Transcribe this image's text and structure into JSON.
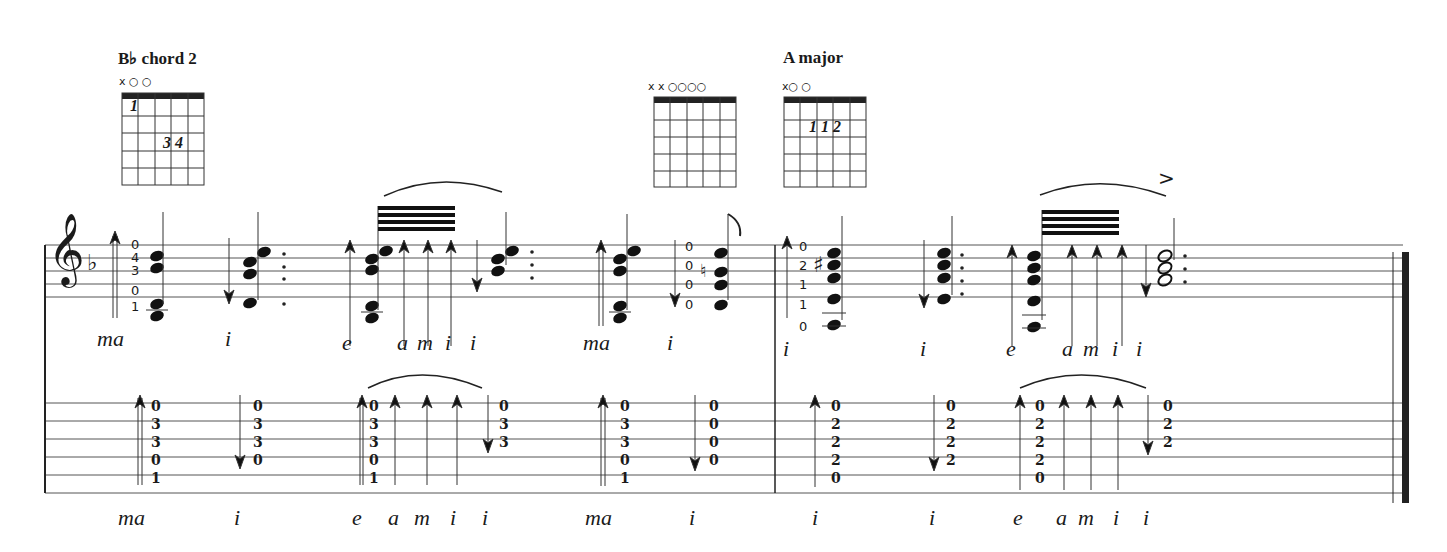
{
  "chords": [
    {
      "title": "B♭ chord 2",
      "markers": "x  ○        ○",
      "fingers": "1",
      "fingers2": "3 4"
    },
    {
      "title": "",
      "markers": "x x ○○○○",
      "fingers": ""
    },
    {
      "title": "A major",
      "markers": "x○            ○",
      "fingers": "1 1 2"
    }
  ],
  "staff": {
    "clef": "𝄞",
    "key_signature": "♭",
    "fret_labels": [
      [
        "0",
        "4",
        "3",
        "0",
        "1"
      ],
      [
        "0",
        "0",
        "0",
        "0"
      ],
      [
        "0",
        "2",
        "1",
        "1",
        "0"
      ]
    ],
    "accent": ">",
    "flag": "♪"
  },
  "notation_fingering": [
    "ma",
    "i",
    "e",
    "a",
    "m",
    "i",
    "i",
    "ma",
    "i",
    "i",
    "i",
    "e",
    "a",
    "m",
    "i",
    "i"
  ],
  "tab": {
    "columns": [
      [
        "0",
        "3",
        "3",
        "0",
        "1"
      ],
      [
        "0",
        "3",
        "3",
        "0"
      ],
      [
        "0",
        "3",
        "3",
        "0",
        "1"
      ],
      [
        "0",
        "3",
        "3"
      ],
      [
        "0",
        "3",
        "3",
        "0",
        "1"
      ],
      [
        "0",
        "0",
        "0",
        "0"
      ],
      [
        "0",
        "2",
        "2",
        "2",
        "0"
      ],
      [
        "0",
        "2",
        "2",
        "2"
      ],
      [
        "0",
        "2",
        "2",
        "2",
        "0"
      ],
      [
        "0",
        "2",
        "2"
      ]
    ]
  },
  "tab_fingering": [
    "ma",
    "i",
    "e",
    "a",
    "m",
    "i",
    "i",
    "ma",
    "i",
    "i",
    "i",
    "e",
    "a",
    "m",
    "i",
    "i"
  ]
}
